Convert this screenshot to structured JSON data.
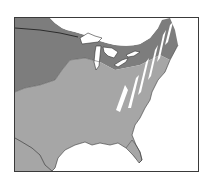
{
  "map": {
    "subject": "Eastern United States range map",
    "legend": [],
    "regions": [
      {
        "name": "range-light",
        "color": "#a6a6a6",
        "description": "light gray shaded range covering most of eastern US"
      },
      {
        "name": "range-dark",
        "color": "#7d7d7d",
        "description": "darker gray region in northern plains / Great Lakes / Canada"
      },
      {
        "name": "hatched-area",
        "color": "#ffffff",
        "description": "white diagonal stripes over Appalachian region"
      },
      {
        "name": "unshaded",
        "color": "#ffffff",
        "description": "white area in northern Canada and ocean/Gulf"
      }
    ],
    "colors": {
      "frame": "#3a3a3a",
      "border_line": "#222222",
      "water": "#ffffff"
    }
  }
}
